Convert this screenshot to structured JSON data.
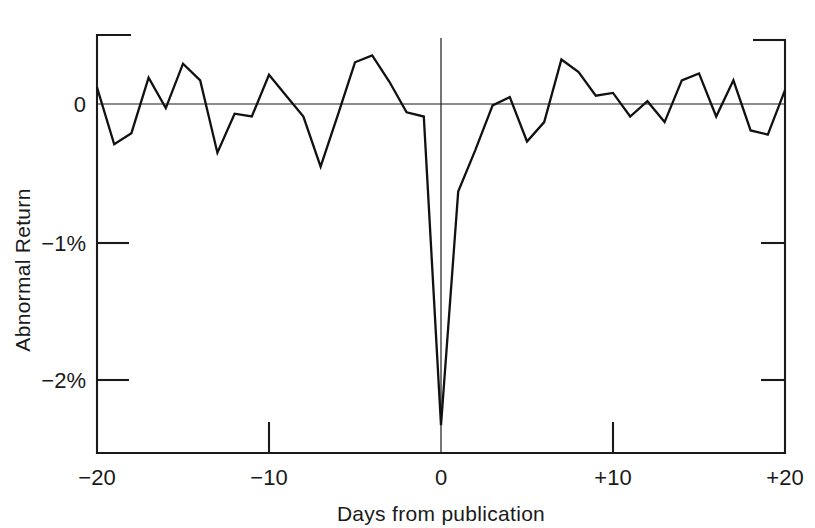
{
  "chart_data": {
    "type": "line",
    "title": "",
    "subtitle": "",
    "xlabel": "Days from publication",
    "ylabel": "Abnormal Return",
    "xlim": [
      -20,
      20
    ],
    "ylim": [
      -2.53,
      0.33
    ],
    "grid": false,
    "legend": null,
    "zero_reference_line": true,
    "xticks": [
      -20,
      -10,
      0,
      10,
      20
    ],
    "xticklabels": [
      "−20",
      "−10",
      "0",
      "+10",
      "+20"
    ],
    "yticks": [
      0,
      -1,
      -2
    ],
    "yticklabels": [
      "0",
      "−1%",
      "−2%"
    ],
    "y_unit": "percent",
    "series": [
      {
        "name": "Abnormal Return",
        "color": "#111111",
        "x": [
          -20,
          -19,
          -18,
          -17,
          -16,
          -15,
          -14,
          -13,
          -12,
          -11,
          -10,
          -9,
          -8,
          -7,
          -6,
          -5,
          -4,
          -3,
          -2,
          -1,
          0,
          1,
          2,
          3,
          4,
          5,
          6,
          7,
          8,
          9,
          10,
          11,
          12,
          13,
          14,
          15,
          16,
          17,
          18,
          19,
          20
        ],
        "values": [
          0.12,
          -0.29,
          -0.21,
          0.19,
          -0.03,
          0.29,
          0.17,
          -0.35,
          -0.07,
          -0.09,
          0.21,
          0.06,
          -0.09,
          -0.45,
          -0.08,
          0.3,
          0.35,
          0.16,
          -0.06,
          -0.09,
          -2.31,
          -0.63,
          -0.33,
          -0.01,
          0.05,
          -0.27,
          -0.13,
          0.32,
          0.23,
          0.06,
          0.08,
          -0.09,
          0.02,
          -0.13,
          0.17,
          0.22,
          -0.09,
          0.17,
          -0.19,
          -0.22,
          0.1
        ]
      }
    ],
    "annotations": []
  },
  "axes": {
    "y_axis_label": "Abnormal Return",
    "x_axis_label": "Days from publication",
    "y_tick_labels": [
      "0",
      "−1%",
      "−2%"
    ],
    "x_tick_labels": [
      "−20",
      "−10",
      "0",
      "+10",
      "+20"
    ]
  },
  "colors": {
    "line": "#111111",
    "axis": "#1a1a1a",
    "background": "#ffffff"
  }
}
